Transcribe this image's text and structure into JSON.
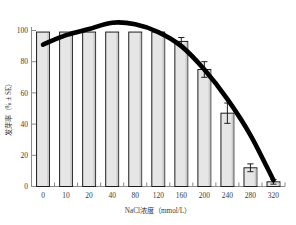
{
  "chart_data": {
    "type": "bar",
    "title": "",
    "xlabel": "NaCl浓度（mmol/L）",
    "ylabel": "发芽率（% ± SE）",
    "categories": [
      "0",
      "10",
      "20",
      "40",
      "80",
      "120",
      "160",
      "200",
      "240",
      "280",
      "320"
    ],
    "values": [
      99,
      99,
      99,
      99,
      99,
      99,
      93,
      75,
      47,
      12,
      3
    ],
    "errors": [
      0,
      0,
      0,
      0,
      0,
      0,
      2.5,
      5,
      6.5,
      2.5,
      1.5
    ],
    "xtick_labels": [
      "0",
      "10",
      "20",
      "40",
      "80",
      "120",
      "160",
      "200",
      "240",
      "280",
      "320"
    ],
    "ytick_labels": [
      "0",
      "20",
      "40",
      "60",
      "80",
      "100"
    ],
    "ytick_values": [
      0,
      20,
      40,
      60,
      80,
      100
    ],
    "ylim": [
      0,
      108
    ],
    "grid": false,
    "legend": "none",
    "series": [
      {
        "name": "发芽率",
        "values": [
          99,
          99,
          99,
          99,
          99,
          99,
          93,
          75,
          47,
          12,
          3
        ]
      },
      {
        "name": "拟合曲线",
        "type": "line",
        "x": [
          0,
          10,
          20,
          40,
          80,
          120,
          160,
          200,
          240,
          280,
          320
        ],
        "values": [
          91,
          97,
          101,
          105,
          104,
          99,
          90,
          75,
          56,
          33,
          4
        ]
      }
    ],
    "bar_fill_color": "#e6e6e6",
    "bar_edge_color": "#1d1d1d",
    "curve_color": "#000000"
  }
}
